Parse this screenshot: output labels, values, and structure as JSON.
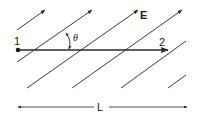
{
  "diagram": {
    "labels": {
      "point_start": "1",
      "point_end": "2",
      "field": "E",
      "angle": "θ",
      "length": "L"
    },
    "colors": {
      "ink": "#2a2a2a",
      "background": "#ffffff"
    },
    "field_line_count": 6,
    "field_lines_with_arrowheads": 4
  }
}
